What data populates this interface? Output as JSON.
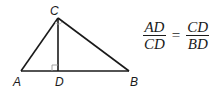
{
  "figure": {
    "points": {
      "A": {
        "label": "A",
        "x": 21,
        "y": 71
      },
      "B": {
        "label": "B",
        "x": 129,
        "y": 71
      },
      "C": {
        "label": "C",
        "x": 58,
        "y": 18
      },
      "D": {
        "label": "D",
        "x": 58,
        "y": 71
      }
    },
    "right_angle_at": "D",
    "colors": {
      "stroke": "#1a1a1a",
      "right_angle_mark": "#9a9a9a"
    }
  },
  "formula": {
    "left": {
      "numerator": "AD",
      "denominator": "CD"
    },
    "operator": "=",
    "right": {
      "numerator": "CD",
      "denominator": "BD"
    }
  }
}
